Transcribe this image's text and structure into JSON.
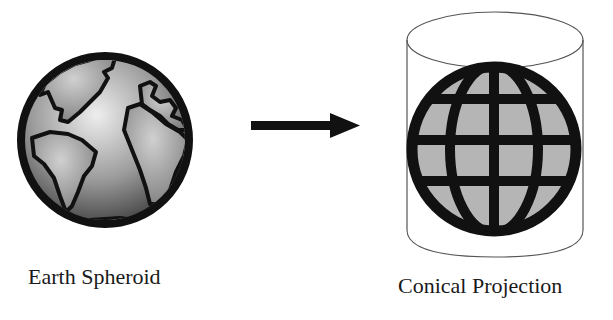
{
  "diagram": {
    "left": {
      "caption": "Earth Spheroid",
      "icon": "earth-globe-icon"
    },
    "arrow": {
      "icon": "right-arrow-icon",
      "direction": "right"
    },
    "right": {
      "caption": "Conical Projection",
      "icon": "wireframe-globe-in-cylinder-icon"
    }
  },
  "colors": {
    "background": "#ffffff",
    "outline": "#111111",
    "land_fill": "#9a9a9a",
    "globe_grid_fill": "#b5b5b5",
    "cylinder_stroke": "#555555"
  }
}
